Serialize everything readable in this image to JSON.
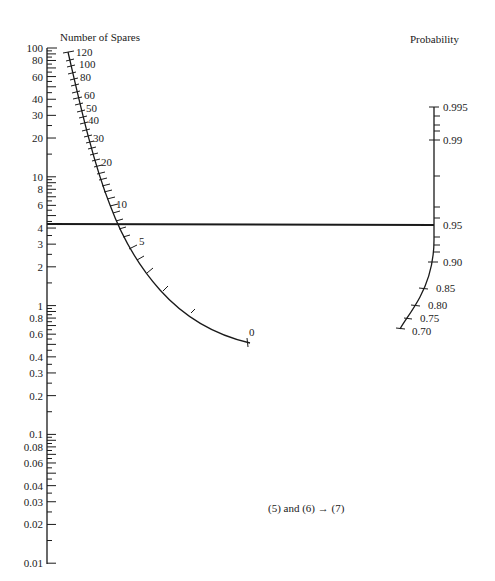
{
  "left_axis": {
    "title": "Number of Spares",
    "labels": [
      "100",
      "80",
      "60",
      "40",
      "30",
      "20",
      "10",
      "8",
      "6",
      "4",
      "3",
      "2",
      "1",
      "0.8",
      "0.6",
      "0.4",
      "0.3",
      "0.2",
      "0.1",
      "0.08",
      "0.06",
      "0.04",
      "0.03",
      "0.02",
      "0.01"
    ],
    "values": [
      100,
      80,
      60,
      40,
      30,
      20,
      10,
      8,
      6,
      4,
      3,
      2,
      1,
      0.8,
      0.6,
      0.4,
      0.3,
      0.2,
      0.1,
      0.08,
      0.06,
      0.04,
      0.03,
      0.02,
      0.01
    ],
    "scale": "log",
    "range": [
      0.01,
      100
    ]
  },
  "spares_curve": {
    "labels": [
      "120",
      "100",
      "80",
      "60",
      "50",
      "40",
      "30",
      "20",
      "10",
      "5",
      "0"
    ]
  },
  "right_axis": {
    "title": "Probability",
    "labels": [
      "0.995",
      "0.99",
      "0.95",
      "0.90",
      "0.85",
      "0.80",
      "0.75",
      "0.70"
    ]
  },
  "index_line": {
    "left_value": 4.4,
    "right_value": 0.95
  },
  "caption": "(5) and (6) → (7)",
  "chart_data": {
    "type": "nomogram",
    "title": "",
    "scales": [
      {
        "name": "Number of Spares (left log scale)",
        "min": 0.01,
        "max": 100,
        "ticks": [
          100,
          80,
          60,
          40,
          30,
          20,
          10,
          8,
          6,
          4,
          3,
          2,
          1,
          0.8,
          0.6,
          0.4,
          0.3,
          0.2,
          0.1,
          0.08,
          0.06,
          0.04,
          0.03,
          0.02,
          0.01
        ]
      },
      {
        "name": "Number of Spares (curved scale)",
        "ticks": [
          120,
          100,
          80,
          60,
          50,
          40,
          30,
          20,
          10,
          5,
          0
        ]
      },
      {
        "name": "Probability (right scale)",
        "ticks": [
          0.995,
          0.99,
          0.95,
          0.9,
          0.85,
          0.8,
          0.75,
          0.7
        ]
      }
    ],
    "index_line": {
      "from_left_scale": 4.4,
      "through_curve_spares": 7,
      "to_probability": 0.95
    },
    "annotation": "(5) and (6) → (7)"
  }
}
